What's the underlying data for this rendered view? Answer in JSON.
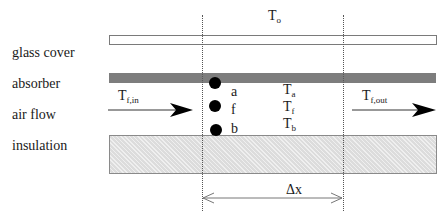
{
  "diagram": {
    "title_symbol": {
      "main": "T",
      "sub": "o"
    },
    "layer_labels": {
      "glass_cover": "glass cover",
      "absorber": "absorber",
      "air_flow": "air flow",
      "insulation": "insulation"
    },
    "inlet": {
      "main": "T",
      "sub": "f,in"
    },
    "outlet": {
      "main": "T",
      "sub": "f,out"
    },
    "nodes": [
      {
        "letter": "a",
        "temp_main": "T",
        "temp_sub": "a"
      },
      {
        "letter": "f",
        "temp_main": "T",
        "temp_sub": "f"
      },
      {
        "letter": "b",
        "temp_main": "T",
        "temp_sub": "b"
      }
    ],
    "dimension_label": "Δx",
    "colors": {
      "absorber": "#7d7d7d",
      "insulation": "#dcdcdc",
      "node": "#000000",
      "line": "#555555"
    }
  }
}
